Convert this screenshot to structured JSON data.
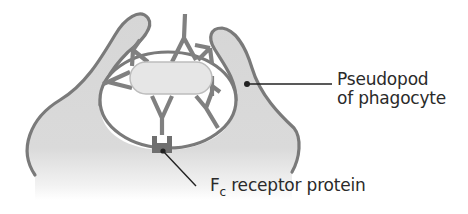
{
  "figure": {
    "labels": {
      "pseudopod_line1": "Pseudopod",
      "pseudopod_line2": "of phagocyte",
      "fc_main": "F",
      "fc_sub": "c",
      "fc_rest": " receptor protein"
    },
    "elements": {
      "phagocyte": "phagocyte cell with two pseudopods",
      "bacterium": "rod-shaped bacterium",
      "antibodies": "Y-shaped antibodies bound to bacterium",
      "fc_receptor": "Fc receptor protein on phagocyte membrane"
    },
    "colors": {
      "cell_fill": "#d9d9d9",
      "membrane": "#7a7a7a",
      "antibody": "#808080",
      "bacterium_fill": "#e6e6e6",
      "receptor": "#6f6f6f",
      "leader_line": "#222222",
      "text": "#2a2a2a"
    }
  }
}
